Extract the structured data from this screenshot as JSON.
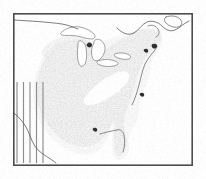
{
  "figure": {
    "type": "species-distribution-range-map",
    "region": "Eastern United States and southeastern Canada",
    "title": "",
    "caption": "",
    "background_color": "#ffffff",
    "frame": {
      "name": "map-border-frame",
      "x": 13,
      "y": 13,
      "width": 180,
      "height": 153,
      "stroke_color": "#4a4a4a",
      "fill_color": "#ffffff",
      "stroke_width": 1.6
    }
  },
  "legend_colors": {
    "primary_range_fill": "#7f7f7f",
    "secondary_range_fill": "#a8a8a8",
    "dark_accent_fill": "#2b2b2b",
    "unshaded_gap_fill": "#ffffff",
    "hatch_stroke": "#8c8c8c",
    "coastline_stroke": "#595959",
    "political_border_stroke": "#4f4f4f"
  },
  "map_features": {
    "primary_range": {
      "name": "primary-range-shading",
      "description": "Continuous medium-gray shaded distribution covering the eastern deciduous forest region from the Great Lakes south to the Gulf Coast and east to the Atlantic seaboard",
      "fill": "#7f7f7f"
    },
    "secondary_range": {
      "name": "secondary-range-shading",
      "description": "Lighter gray fringe along the Atlantic coastal plain, the Florida peninsula and the western range margin",
      "fill": "#a8a8a8"
    },
    "dark_accents": {
      "name": "dark-range-accents",
      "description": "Small near-black patches near the upper Great Lakes, Cape Cod, Long Island and the mid-Atlantic coast",
      "fill": "#2b2b2b"
    },
    "interior_gap": {
      "name": "interior-unshaded-gap",
      "description": "Diagonal unshaded white band with four tapered white bars across the lower Ohio and central Mississippi valley",
      "bar_count": 4,
      "fill": "#ffffff"
    },
    "hatch_band": {
      "name": "western-hatch-band",
      "description": "Five vertical gray hatch lines over the southern Great Plains indicating scattered or disjunct western occurrences",
      "line_count": 5,
      "stroke": "#8c8c8c",
      "x_positions": [
        17,
        23.5,
        30,
        36.5,
        43
      ],
      "y_top": 82,
      "y_bottom": 163
    },
    "great_lakes": {
      "name": "great-lakes-outlines",
      "description": "White outlined water bodies: Superior, Michigan, Huron, Erie and Ontario",
      "lakes": [
        "Superior",
        "Michigan",
        "Huron",
        "Erie",
        "Ontario"
      ],
      "fill": "#ffffff"
    },
    "political_borders": {
      "name": "political-border-lines",
      "description": "The 49th parallel United States-Canada boundary across the north, the St. Lawrence River boundary to the northeast, and the Rio Grande United States-Mexico boundary at the southwest",
      "stroke": "#4f4f4f"
    },
    "coastlines": {
      "name": "coastline-outlines",
      "description": "Atlantic seaboard, Gulf of Mexico, Gulf of St. Lawrence and Nova Scotia shorelines",
      "stroke": "#595959"
    }
  }
}
